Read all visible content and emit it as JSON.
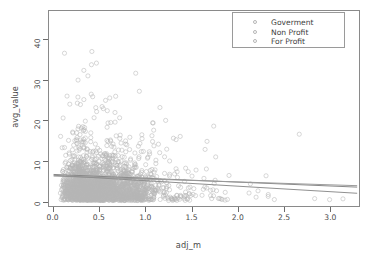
{
  "chart_data": {
    "type": "scatter",
    "title": "",
    "xlabel": "adj_m",
    "ylabel": "avg_value",
    "xlim": [
      -0.05,
      3.32
    ],
    "ylim": [
      -1.2,
      47
    ],
    "grid": false,
    "xticks": [
      0.0,
      0.5,
      1.0,
      1.5,
      2.0,
      2.5,
      3.0
    ],
    "xtick_labels": [
      "0.0",
      "0.5",
      "1.0",
      "1.5",
      "2.0",
      "2.5",
      "3.0"
    ],
    "yticks": [
      0,
      10,
      20,
      30,
      40
    ],
    "ytick_labels": [
      "0",
      "10",
      "20",
      "30",
      "40"
    ],
    "marker": "open-circle",
    "marker_color": "#b6b6b6",
    "point_count_approx": 2600,
    "legend": {
      "position": "top-right",
      "entries": [
        {
          "label": "Goverment",
          "color": "#b6b6b6"
        },
        {
          "label": "Non Profit",
          "color": "#b6b6b6"
        },
        {
          "label": "For Profit",
          "color": "#b6b6b6"
        }
      ]
    },
    "series": [
      {
        "name": "Goverment",
        "color": "#b6b6b6",
        "regression": {
          "intercept": 6.6,
          "slope": -0.95,
          "color": "#888888",
          "x_range": [
            0.0,
            3.3
          ]
        }
      },
      {
        "name": "Non Profit",
        "color": "#b6b6b6",
        "regression": {
          "intercept": 6.2,
          "slope": -0.72,
          "color": "#9a9a9a",
          "x_range": [
            0.0,
            3.3
          ]
        }
      },
      {
        "name": "For Profit",
        "color": "#b6b6b6",
        "regression": {
          "intercept": 6.4,
          "slope": -1.35,
          "color": "#8f8f8f",
          "x_range": [
            0.0,
            3.3
          ]
        }
      }
    ]
  }
}
